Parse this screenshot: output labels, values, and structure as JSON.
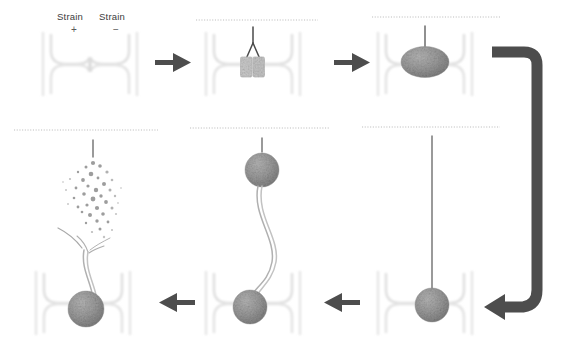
{
  "figure": {
    "background_color": "#ffffff",
    "arrow_color": "#4d4d4d",
    "blob_color": "#8f8f8f",
    "channel_color": "#e2e2e2",
    "filament_color": "#a8a8a8",
    "dotted_line_color": "#b9b9b9",
    "text_color": "#3c3c3c"
  },
  "labels": {
    "strain_plus_name": "Strain",
    "strain_plus_sign": "+",
    "strain_minus_name": "Strain",
    "strain_minus_sign": "−"
  },
  "panels": [
    {
      "id": "panel-1",
      "order": 1,
      "caption": "Empty microfluidic trap with Strain + and Strain − inlets",
      "has_dotted_line": false,
      "has_cantilever": false,
      "content": "empty-trap"
    },
    {
      "id": "panel-2",
      "order": 2,
      "caption": "Two cells captured in trap, cantilever tip forked above",
      "has_dotted_line": true,
      "has_cantilever": true,
      "content": "two-cells-forked-tip"
    },
    {
      "id": "panel-3",
      "order": 3,
      "caption": "Cells fused into single aggregate attached to cantilever",
      "has_dotted_line": true,
      "has_cantilever": true,
      "content": "fused-aggregate"
    },
    {
      "id": "panel-4",
      "order": 4,
      "caption": "Aggregate held in trap, cantilever retracted to full height",
      "has_dotted_line": true,
      "has_cantilever": true,
      "content": "aggregate-long-cantilever"
    },
    {
      "id": "panel-5",
      "order": 5,
      "caption": "Aggregate lifted, adhesive filament necking between cell bodies",
      "has_dotted_line": true,
      "has_cantilever": true,
      "content": "stretched-filament"
    },
    {
      "id": "panel-6",
      "order": 6,
      "caption": "Filament ruptures, upper cell disperses into scattered fragments",
      "has_dotted_line": true,
      "has_cantilever": true,
      "content": "ruptured-dispersed"
    }
  ],
  "arrows": [
    {
      "id": "arrow-1-2",
      "direction": "right",
      "name": "step-arrow-1-to-2"
    },
    {
      "id": "arrow-2-3",
      "direction": "right",
      "name": "step-arrow-2-to-3"
    },
    {
      "id": "arrow-3-4",
      "direction": "down-left-curve",
      "name": "wrap-arrow-3-to-4"
    },
    {
      "id": "arrow-4-5",
      "direction": "left",
      "name": "step-arrow-4-to-5"
    },
    {
      "id": "arrow-5-6",
      "direction": "left",
      "name": "step-arrow-5-to-6"
    }
  ]
}
